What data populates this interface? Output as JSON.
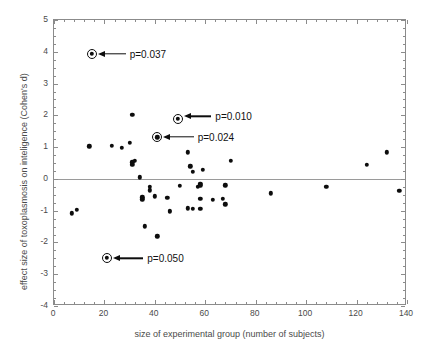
{
  "chart_data": {
    "type": "scatter",
    "title": "",
    "xlabel": "size of experimental group (number of subjects)",
    "ylabel": "effect size of toxoplasmosis on inteligence (Cohen's d)",
    "xlim": [
      0,
      140
    ],
    "ylim": [
      -4,
      5
    ],
    "xticks": [
      0,
      20,
      40,
      60,
      80,
      100,
      120,
      140
    ],
    "yticks": [
      -4,
      -3,
      -2,
      -1,
      0,
      1,
      2,
      3,
      4,
      5
    ],
    "xtick_labels": [
      "0",
      "20",
      "40",
      "60",
      "80",
      "100",
      "120",
      "140"
    ],
    "ytick_labels": [
      "-4",
      "-3",
      "-2",
      "-1",
      "0",
      "1",
      "2",
      "3",
      "4",
      "5"
    ],
    "grid": false,
    "legend": null,
    "reference_line": {
      "axis": "y",
      "value": 0,
      "color": "#9a9a9a"
    },
    "marker_color": "#0d0d0d",
    "points": [
      {
        "x": 7,
        "y": -1.08
      },
      {
        "x": 9,
        "y": -0.98
      },
      {
        "x": 14,
        "y": 1.02
      },
      {
        "x": 15,
        "y": 3.93,
        "highlighted": true,
        "label": "p=0.037"
      },
      {
        "x": 21,
        "y": -2.48,
        "highlighted": true,
        "label": "p=0.050"
      },
      {
        "x": 23,
        "y": 1.04
      },
      {
        "x": 27,
        "y": 0.97
      },
      {
        "x": 30,
        "y": 1.13
      },
      {
        "x": 31,
        "y": 2.01
      },
      {
        "x": 31,
        "y": 0.52
      },
      {
        "x": 31,
        "y": 0.44
      },
      {
        "x": 32,
        "y": 0.56
      },
      {
        "x": 34,
        "y": 0.05
      },
      {
        "x": 35,
        "y": -0.58
      },
      {
        "x": 35,
        "y": -0.64
      },
      {
        "x": 36,
        "y": -1.49
      },
      {
        "x": 38,
        "y": -0.25
      },
      {
        "x": 38,
        "y": -0.36
      },
      {
        "x": 40,
        "y": -0.55
      },
      {
        "x": 41,
        "y": -1.81
      },
      {
        "x": 41,
        "y": 1.31,
        "highlighted": true,
        "label": "p=0.024"
      },
      {
        "x": 45,
        "y": -0.59
      },
      {
        "x": 46,
        "y": -1.0
      },
      {
        "x": 46,
        "y": -1.04
      },
      {
        "x": 49,
        "y": 1.89,
        "highlighted": true,
        "label": "p=0.010"
      },
      {
        "x": 50,
        "y": -0.22
      },
      {
        "x": 53,
        "y": 0.84
      },
      {
        "x": 53,
        "y": -0.93
      },
      {
        "x": 54,
        "y": 0.4
      },
      {
        "x": 55,
        "y": 0.22
      },
      {
        "x": 55,
        "y": -0.94
      },
      {
        "x": 57,
        "y": -0.25
      },
      {
        "x": 58,
        "y": -0.15
      },
      {
        "x": 58,
        "y": -0.2
      },
      {
        "x": 58,
        "y": -0.63
      },
      {
        "x": 58,
        "y": -0.94
      },
      {
        "x": 59,
        "y": 0.29
      },
      {
        "x": 63,
        "y": -0.66
      },
      {
        "x": 67,
        "y": -0.63
      },
      {
        "x": 68,
        "y": -0.8
      },
      {
        "x": 68,
        "y": -0.2
      },
      {
        "x": 70,
        "y": 0.56
      },
      {
        "x": 86,
        "y": -0.45
      },
      {
        "x": 108,
        "y": -0.25
      },
      {
        "x": 124,
        "y": 0.44
      },
      {
        "x": 132,
        "y": 0.84
      },
      {
        "x": 137,
        "y": -0.37
      }
    ],
    "annotations": [
      {
        "label": "p=0.037",
        "point_x": 15,
        "point_y": 3.93,
        "text_x": 30,
        "text_y": 3.93
      },
      {
        "label": "p=0.010",
        "point_x": 49,
        "point_y": 1.89,
        "text_x": 64,
        "text_y": 1.97
      },
      {
        "label": "p=0.024",
        "point_x": 41,
        "point_y": 1.31,
        "text_x": 57,
        "text_y": 1.33
      },
      {
        "label": "p=0.050",
        "point_x": 21,
        "point_y": -2.48,
        "text_x": 37,
        "text_y": -2.5
      }
    ]
  }
}
